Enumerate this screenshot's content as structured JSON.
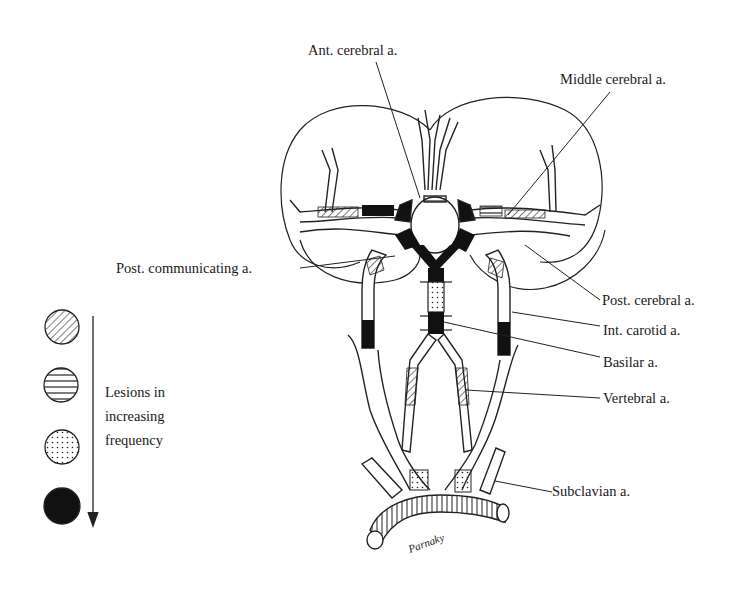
{
  "diagram": {
    "labels": {
      "ant_cerebral": "Ant. cerebral a.",
      "middle_cerebral": "Middle cerebral a.",
      "post_communicating": "Post. communicating a.",
      "post_cerebral": "Post. cerebral a.",
      "int_carotid": "Int. carotid a.",
      "basilar": "Basilar a.",
      "vertebral": "Vertebral a.",
      "subclavian": "Subclavian a."
    },
    "legend": {
      "line1": "Lesions in",
      "line2": "increasing",
      "line3": "frequency",
      "items": [
        {
          "pattern": "diagonal-hatch",
          "rank": 1
        },
        {
          "pattern": "horizontal-hatch",
          "rank": 2
        },
        {
          "pattern": "stippled",
          "rank": 3
        },
        {
          "pattern": "solid-black",
          "rank": 4
        }
      ],
      "arrow_direction": "down"
    },
    "signature": "Parnaky"
  }
}
